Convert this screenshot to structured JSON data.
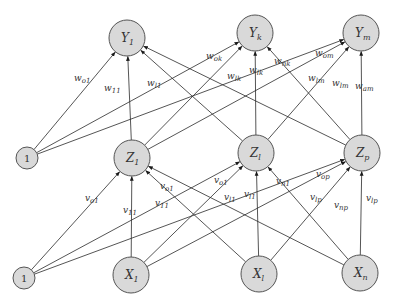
{
  "diagram": {
    "type": "feedforward-neural-network",
    "colors": {
      "node_fill": "#d9d9d9",
      "node_stroke": "#555555",
      "edge": "#2a2a2a",
      "text": "#333333",
      "background": "#ffffff"
    },
    "layers": {
      "output": [
        {
          "id": "Y1",
          "base": "Y",
          "sub": "1",
          "cx": 127,
          "cy": 38,
          "r": 18
        },
        {
          "id": "Yk",
          "base": "Y",
          "sub": "k",
          "cx": 255,
          "cy": 33,
          "r": 18
        },
        {
          "id": "Ym",
          "base": "Y",
          "sub": "m",
          "cx": 361,
          "cy": 33,
          "r": 18
        }
      ],
      "hidden": [
        {
          "id": "Bh",
          "base": "1",
          "sub": "",
          "cx": 27,
          "cy": 158,
          "r": 11,
          "bias": true
        },
        {
          "id": "Z1",
          "base": "Z",
          "sub": "1",
          "cx": 132,
          "cy": 158,
          "r": 18
        },
        {
          "id": "Zl",
          "base": "Z",
          "sub": "l",
          "cx": 256,
          "cy": 153,
          "r": 18
        },
        {
          "id": "Zp",
          "base": "Z",
          "sub": "p",
          "cx": 362,
          "cy": 153,
          "r": 18
        }
      ],
      "input": [
        {
          "id": "Bi",
          "base": "1",
          "sub": "",
          "cx": 24,
          "cy": 278,
          "r": 11,
          "bias": true
        },
        {
          "id": "X1",
          "base": "X",
          "sub": "1",
          "cx": 131,
          "cy": 275,
          "r": 18
        },
        {
          "id": "Xl",
          "base": "X",
          "sub": "l",
          "cx": 259,
          "cy": 274,
          "r": 18
        },
        {
          "id": "Xn",
          "base": "X",
          "sub": "n",
          "cx": 360,
          "cy": 273,
          "r": 18
        }
      ]
    },
    "edges": [
      {
        "from": "Bh",
        "to": "Y1"
      },
      {
        "from": "Bh",
        "to": "Yk"
      },
      {
        "from": "Bh",
        "to": "Ym"
      },
      {
        "from": "Z1",
        "to": "Y1"
      },
      {
        "from": "Z1",
        "to": "Yk"
      },
      {
        "from": "Z1",
        "to": "Ym"
      },
      {
        "from": "Zl",
        "to": "Y1"
      },
      {
        "from": "Zl",
        "to": "Yk"
      },
      {
        "from": "Zl",
        "to": "Ym"
      },
      {
        "from": "Zp",
        "to": "Y1"
      },
      {
        "from": "Zp",
        "to": "Yk"
      },
      {
        "from": "Zp",
        "to": "Ym"
      },
      {
        "from": "Bi",
        "to": "Z1"
      },
      {
        "from": "Bi",
        "to": "Zl"
      },
      {
        "from": "Bi",
        "to": "Zp"
      },
      {
        "from": "X1",
        "to": "Z1"
      },
      {
        "from": "X1",
        "to": "Zl"
      },
      {
        "from": "X1",
        "to": "Zp"
      },
      {
        "from": "Xl",
        "to": "Z1"
      },
      {
        "from": "Xl",
        "to": "Zl"
      },
      {
        "from": "Xl",
        "to": "Zp"
      },
      {
        "from": "Xn",
        "to": "Z1"
      },
      {
        "from": "Xn",
        "to": "Zl"
      },
      {
        "from": "Xn",
        "to": "Zp"
      }
    ],
    "weight_labels": [
      {
        "base": "w",
        "sub": "o1",
        "x": 74,
        "y": 81
      },
      {
        "base": "w",
        "sub": "11",
        "x": 104,
        "y": 91
      },
      {
        "base": "w",
        "sub": "l1",
        "x": 147,
        "y": 86
      },
      {
        "base": "w",
        "sub": "ok",
        "x": 206,
        "y": 59
      },
      {
        "base": "w",
        "sub": "lk",
        "x": 227,
        "y": 79
      },
      {
        "base": "w",
        "sub": "lk",
        "x": 249,
        "y": 73
      },
      {
        "base": "w",
        "sub": "nk",
        "x": 274,
        "y": 64
      },
      {
        "base": "w",
        "sub": "om",
        "x": 315,
        "y": 56
      },
      {
        "base": "w",
        "sub": "lm",
        "x": 308,
        "y": 81
      },
      {
        "base": "w",
        "sub": "lm",
        "x": 332,
        "y": 86
      },
      {
        "base": "w",
        "sub": "am",
        "x": 355,
        "y": 89
      },
      {
        "base": "v",
        "sub": "o1",
        "x": 85,
        "y": 201
      },
      {
        "base": "v",
        "sub": "11",
        "x": 123,
        "y": 213
      },
      {
        "base": "v",
        "sub": "11",
        "x": 155,
        "y": 206
      },
      {
        "base": "v",
        "sub": "o1",
        "x": 160,
        "y": 189
      },
      {
        "base": "v",
        "sub": "o1",
        "x": 214,
        "y": 183
      },
      {
        "base": "v",
        "sub": "l1",
        "x": 224,
        "y": 200
      },
      {
        "base": "v",
        "sub": "l1",
        "x": 244,
        "y": 197
      },
      {
        "base": "v",
        "sub": "n1",
        "x": 276,
        "y": 184
      },
      {
        "base": "v",
        "sub": "op",
        "x": 316,
        "y": 177
      },
      {
        "base": "v",
        "sub": "lp",
        "x": 310,
        "y": 200
      },
      {
        "base": "v",
        "sub": "np",
        "x": 334,
        "y": 208
      },
      {
        "base": "v",
        "sub": "lp",
        "x": 366,
        "y": 201
      }
    ]
  }
}
